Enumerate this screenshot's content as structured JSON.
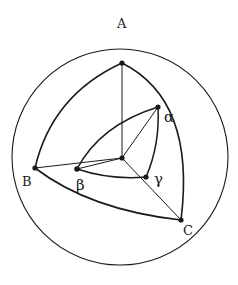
{
  "diagram": {
    "labels": {
      "A": "A",
      "B": "B",
      "C": "C",
      "alpha": "α",
      "beta": "β",
      "gamma": "γ"
    },
    "colors": {
      "stroke": "#1a1a1a",
      "background": "#ffffff"
    }
  }
}
